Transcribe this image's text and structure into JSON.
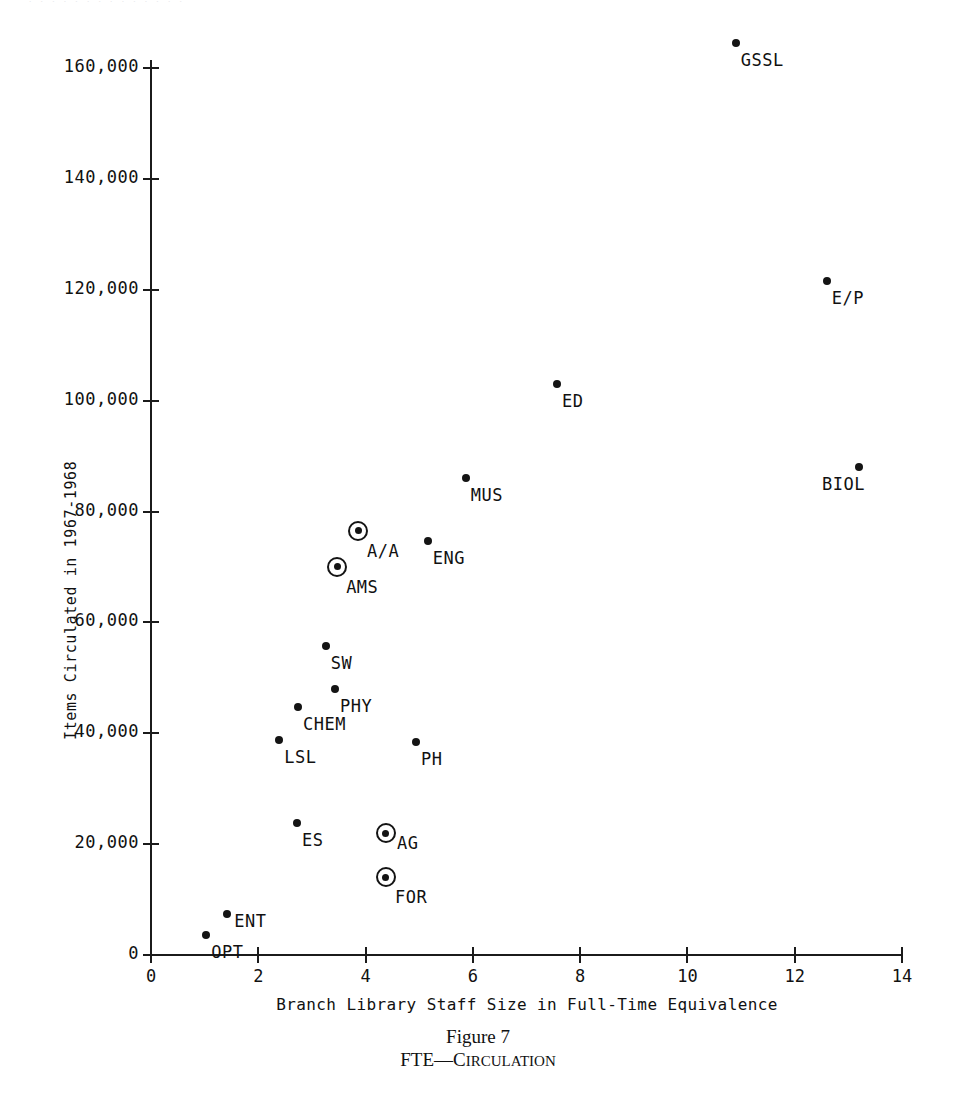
{
  "page": {
    "top_running_head_fragment": "· · · · · · · · · · · · · ·"
  },
  "caption": {
    "figure_number": "Figure 7",
    "title_lead": "FTE",
    "title_dash": "—",
    "title_rest": "Circulation",
    "full_title": "FTE—Circulation"
  },
  "chart_data": {
    "type": "scatter",
    "title": "FTE—Circulation",
    "xlabel": "Branch Library Staff Size in Full-Time Equivalence",
    "ylabel": "Items Circulated in 1967-1968",
    "xlim": [
      0,
      14
    ],
    "ylim": [
      0,
      166000
    ],
    "grid": false,
    "legend": "none",
    "xticks": [
      0,
      2,
      4,
      6,
      8,
      10,
      12,
      14
    ],
    "xtick_labels": [
      "0",
      "2",
      "4",
      "6",
      "8",
      "10",
      "12",
      "14"
    ],
    "yticks": [
      0,
      20000,
      40000,
      60000,
      80000,
      100000,
      120000,
      140000,
      160000
    ],
    "ytick_labels": [
      "0",
      "20,000",
      "40,000",
      "60,000",
      "80,000",
      "100,000",
      "120,000",
      "140,000",
      "160,000"
    ],
    "marker_styles": {
      "dot": "filled small dot",
      "circled": "filled dot inside open ring"
    },
    "points": [
      {
        "label": "GSSL",
        "x": 10.9,
        "y": 164500,
        "marker": "dot",
        "label_pos": "below-right"
      },
      {
        "label": "E/P",
        "x": 12.6,
        "y": 121500,
        "marker": "dot",
        "label_pos": "below-right"
      },
      {
        "label": "BIOL",
        "x": 13.2,
        "y": 88000,
        "marker": "dot",
        "label_pos": "below-left"
      },
      {
        "label": "ED",
        "x": 7.57,
        "y": 103000,
        "marker": "dot",
        "label_pos": "below-right"
      },
      {
        "label": "MUS",
        "x": 5.87,
        "y": 86000,
        "marker": "dot",
        "label_pos": "below-right"
      },
      {
        "label": "A/A",
        "x": 3.86,
        "y": 76500,
        "marker": "circled",
        "label_pos": "below-right"
      },
      {
        "label": "ENG",
        "x": 5.16,
        "y": 74700,
        "marker": "dot",
        "label_pos": "below-right"
      },
      {
        "label": "AMS",
        "x": 3.47,
        "y": 70000,
        "marker": "circled",
        "label_pos": "below-right"
      },
      {
        "label": "SW",
        "x": 3.26,
        "y": 55700,
        "marker": "dot",
        "label_pos": "below-right"
      },
      {
        "label": "PHY",
        "x": 3.43,
        "y": 48000,
        "marker": "dot",
        "label_pos": "below-right"
      },
      {
        "label": "CHEM",
        "x": 2.74,
        "y": 44700,
        "marker": "dot",
        "label_pos": "below-right"
      },
      {
        "label": "LSL",
        "x": 2.39,
        "y": 38800,
        "marker": "dot",
        "label_pos": "below-right"
      },
      {
        "label": "PH",
        "x": 4.94,
        "y": 38400,
        "marker": "dot",
        "label_pos": "below-right"
      },
      {
        "label": "ES",
        "x": 2.72,
        "y": 23800,
        "marker": "dot",
        "label_pos": "below-right"
      },
      {
        "label": "AG",
        "x": 4.38,
        "y": 22000,
        "marker": "circled",
        "label_pos": "right"
      },
      {
        "label": "FOR",
        "x": 4.38,
        "y": 14000,
        "marker": "circled",
        "label_pos": "below-right"
      },
      {
        "label": "ENT",
        "x": 1.42,
        "y": 7400,
        "marker": "dot",
        "label_pos": "right"
      },
      {
        "label": "OPT",
        "x": 1.03,
        "y": 3600,
        "marker": "dot",
        "label_pos": "below-right"
      }
    ]
  }
}
